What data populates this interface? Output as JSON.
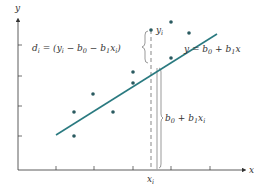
{
  "diagram": {
    "colors": {
      "axis": "#333333",
      "line": "#2a7a80",
      "points": "#2a5a60",
      "guide": "#555555",
      "gray_bar": "#aaaaaa"
    },
    "axes": {
      "y_label": "y",
      "x_label": "x",
      "y_ticks_px": [
        45,
        76,
        106,
        136
      ],
      "x_ticks_px": [
        56,
        94,
        133,
        171,
        210
      ]
    },
    "regression_line": {
      "label_main": "y = b",
      "label_sub0": "0",
      "label_plus": " + b",
      "label_sub1": "1",
      "label_x": "x",
      "start": [
        56,
        135
      ],
      "end": [
        217,
        34
      ]
    },
    "points": [
      [
        74,
        112
      ],
      [
        74,
        136
      ],
      [
        93,
        94
      ],
      [
        113,
        112
      ],
      [
        133,
        72
      ],
      [
        133,
        83
      ],
      [
        151,
        30
      ],
      [
        171,
        22
      ],
      [
        171,
        58
      ],
      [
        189,
        33
      ]
    ],
    "highlight": {
      "xi_label": "x",
      "xi_sub": "i",
      "yi_label": "y",
      "yi_sub": "i",
      "residual_label": {
        "d": "d",
        "d_sub": "i",
        "eq": " = (y",
        "y_sub": "i",
        "minus_b0": " − b",
        "b0_sub": "0",
        "minus_b1": " − b",
        "b1_sub": "1",
        "xi": "x",
        "xi_sub": "i",
        "close": ")"
      },
      "fitted_label": {
        "b": "b",
        "b0_sub": "0",
        "plus": " + b",
        "b1_sub": "1",
        "x": "x",
        "x_sub": "i"
      }
    }
  }
}
